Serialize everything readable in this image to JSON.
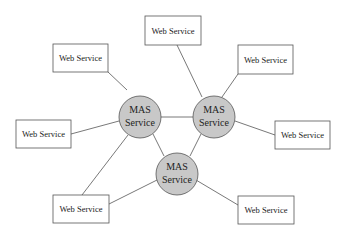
{
  "diagram": {
    "type": "network-topology",
    "colors": {
      "mas_fill": "#c8c8c8",
      "stroke": "#555555",
      "box_fill": "#ffffff",
      "background": "#ffffff"
    },
    "mas_nodes": [
      {
        "id": "mas_left",
        "line1": "MAS",
        "line2": "Service"
      },
      {
        "id": "mas_right",
        "line1": "MAS",
        "line2": "Service"
      },
      {
        "id": "mas_bottom",
        "line1": "MAS",
        "line2": "Service"
      }
    ],
    "web_services": [
      {
        "id": "ws_top_left",
        "label": "Web Service"
      },
      {
        "id": "ws_top",
        "label": "Web Service"
      },
      {
        "id": "ws_top_right",
        "label": "Web Service"
      },
      {
        "id": "ws_left",
        "label": "Web Service"
      },
      {
        "id": "ws_right",
        "label": "Web Service"
      },
      {
        "id": "ws_bottom_left",
        "label": "Web Service"
      },
      {
        "id": "ws_bottom_right",
        "label": "Web Service"
      }
    ],
    "edges": [
      [
        "ws_top_left",
        "mas_left"
      ],
      [
        "ws_left",
        "mas_left"
      ],
      [
        "ws_bottom_left",
        "mas_left"
      ],
      [
        "ws_top",
        "mas_right"
      ],
      [
        "ws_top_right",
        "mas_right"
      ],
      [
        "ws_right",
        "mas_right"
      ],
      [
        "ws_bottom_left",
        "mas_bottom"
      ],
      [
        "ws_bottom_right",
        "mas_bottom"
      ],
      [
        "mas_left",
        "mas_right"
      ],
      [
        "mas_left",
        "mas_bottom"
      ],
      [
        "mas_right",
        "mas_bottom"
      ]
    ]
  }
}
